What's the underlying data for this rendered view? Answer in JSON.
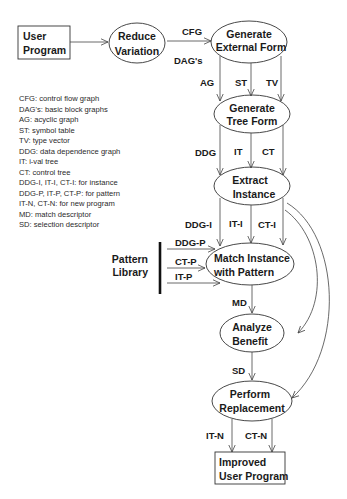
{
  "nodes": {
    "user_program": {
      "line1": "User",
      "line2": "Program"
    },
    "reduce_variation": {
      "line1": "Reduce",
      "line2": "Variation"
    },
    "generate_external_form": {
      "line1": "Generate",
      "line2": "External Form"
    },
    "generate_tree_form": {
      "line1": "Generate",
      "line2": "Tree Form"
    },
    "extract_instance": {
      "line1": "Extract",
      "line2": "Instance"
    },
    "match_instance": {
      "line1": "Match Instance",
      "line2": "with Pattern"
    },
    "analyze_benefit": {
      "line1": "Analyze",
      "line2": "Benefit"
    },
    "perform_replacement": {
      "line1": "Perform",
      "line2": "Replacement"
    },
    "improved_user_program": {
      "line1": "Improved",
      "line2": "User Program"
    },
    "pattern_library": {
      "line1": "Pattern",
      "line2": "Library"
    }
  },
  "edge_labels": {
    "cfg": "CFG",
    "dags": "DAG's",
    "ag": "AG",
    "st": "ST",
    "tv": "TV",
    "ddg": "DDG",
    "it": "IT",
    "ct": "CT",
    "ddg_i": "DDG-I",
    "it_i": "IT-I",
    "ct_i": "CT-I",
    "ddg_p": "DDG-P",
    "ct_p": "CT-P",
    "it_p": "IT-P",
    "md": "MD",
    "sd": "SD",
    "it_n": "IT-N",
    "ct_n": "CT-N"
  },
  "legend": [
    "CFG: control flow graph",
    "DAG's: basic block graphs",
    "AG: acyclic graph",
    "ST: symbol table",
    "TV: type vector",
    "DDG: data dependence graph",
    "IT: i-val tree",
    "CT: control tree",
    "DDG-I, IT-I, CT-I: for instance",
    "DDG-P, IT-P, CT-P: for pattern",
    "IT-N, CT-N: for new program",
    "MD: match descriptor",
    "SD: selection descriptor"
  ]
}
